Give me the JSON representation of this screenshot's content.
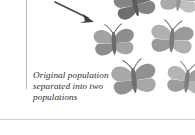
{
  "figure": {
    "title": "Original population separated into two populations",
    "background_color": "#ffffff",
    "caption": {
      "lines": [
        "Original population",
        "separated into two",
        "populations"
      ],
      "color": "#2b2b2b",
      "style": "italic-serif"
    },
    "rules": {
      "vertical_rule_color": "#b9b9b9",
      "bottom_rule_color": "#d2d2d2"
    },
    "arrow": {
      "name": "pointer-arrow",
      "direction": "down-right",
      "color": "#4a4a4a"
    },
    "butterflies": [
      {
        "id": "butterfly-top-dark",
        "x": 112,
        "y": -16,
        "w": 46,
        "h": 40,
        "rot": -14,
        "wing": "#848484",
        "wing_shade": "#6e6e6e",
        "body": "#5b5b5b",
        "opacity": 1
      },
      {
        "id": "butterfly-top-right-faint",
        "x": 158,
        "y": -20,
        "w": 42,
        "h": 38,
        "rot": 8,
        "wing": "#bdbdbd",
        "wing_shade": "#a6a6a6",
        "body": "#8f8f8f",
        "opacity": 0.95
      },
      {
        "id": "butterfly-mid-left",
        "x": 90,
        "y": 22,
        "w": 48,
        "h": 40,
        "rot": -3,
        "wing": "#a3a3a3",
        "wing_shade": "#8d8d8d",
        "body": "#6a6a6a",
        "opacity": 1
      },
      {
        "id": "butterfly-mid-right",
        "x": 148,
        "y": 18,
        "w": 48,
        "h": 42,
        "rot": 4,
        "wing": "#b0b0b0",
        "wing_shade": "#9a9a9a",
        "body": "#7a7a7a",
        "opacity": 1
      },
      {
        "id": "butterfly-bottom-left",
        "x": 108,
        "y": 57,
        "w": 52,
        "h": 44,
        "rot": -6,
        "wing": "#a8a8a8",
        "wing_shade": "#919191",
        "body": "#6f6f6f",
        "opacity": 1
      },
      {
        "id": "butterfly-bottom-right",
        "x": 164,
        "y": 60,
        "w": 46,
        "h": 40,
        "rot": 6,
        "wing": "#b4b4b4",
        "wing_shade": "#9d9d9d",
        "body": "#7d7d7d",
        "opacity": 1
      }
    ]
  }
}
